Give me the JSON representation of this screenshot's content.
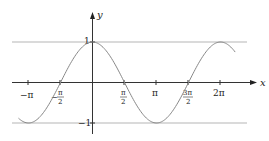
{
  "chart_data": {
    "type": "line",
    "title": "",
    "function": "y = cos(x)",
    "xlabel": "x",
    "ylabel": "y",
    "xlim": [
      -3.6,
      7.1
    ],
    "ylim": [
      -1.1,
      1.1
    ],
    "grid": false,
    "x_ticks": [
      {
        "value": -3.14159,
        "label": "−π"
      },
      {
        "value": -1.5708,
        "label": "−π/2"
      },
      {
        "value": 1.5708,
        "label": "π/2"
      },
      {
        "value": 3.14159,
        "label": "π"
      },
      {
        "value": 4.71239,
        "label": "3π/2"
      },
      {
        "value": 6.28319,
        "label": "2π"
      }
    ],
    "y_ticks": [
      {
        "value": 1,
        "label": "1"
      },
      {
        "value": -1,
        "label": "−1"
      }
    ],
    "reference_lines": [
      {
        "y": 1,
        "label": "y = 1"
      },
      {
        "y": -1,
        "label": "y = −1"
      }
    ],
    "series": [
      {
        "name": "cos(x)",
        "x": [
          -3.6,
          -3.14159,
          -1.5708,
          0,
          1.5708,
          3.14159,
          4.71239,
          6.28319,
          7.0
        ],
        "values": [
          -0.897,
          -1,
          0,
          1,
          0,
          -1,
          0,
          1,
          0.754
        ]
      }
    ],
    "colors": {
      "curve": "#888888",
      "axis": "#333333",
      "ref_line": "#b5b5b5"
    }
  },
  "labels": {
    "x_axis": "x",
    "y_axis": "y",
    "y_one": "1",
    "y_neg_one": "−1",
    "neg_pi": "−π",
    "neg_half_pi_num": "π",
    "neg_half_pi_den": "2",
    "neg_sign": "−",
    "half_pi_num": "π",
    "half_pi_den": "2",
    "pi": "π",
    "three_half_pi_num": "3π",
    "three_half_pi_den": "2",
    "two_pi": "2π"
  }
}
